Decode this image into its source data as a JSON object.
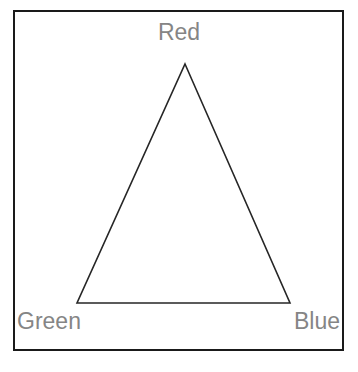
{
  "diagram": {
    "type": "triangle-diagram",
    "title": "",
    "background_color": "#ffffff",
    "frame": {
      "name": "outer-border",
      "stroke_color": "#1a1a1a",
      "stroke_width": 2,
      "fill": "#ffffff"
    },
    "shape": {
      "name": "triangle",
      "stroke_color": "#262626",
      "stroke_width": 1.6,
      "fill": "none",
      "points": "185,64 290,303 77,303"
    },
    "labels": {
      "text_color": "#858585",
      "font_size_px": 23,
      "apex": "Red",
      "bottom_left": "Green",
      "bottom_right": "Blue"
    }
  }
}
